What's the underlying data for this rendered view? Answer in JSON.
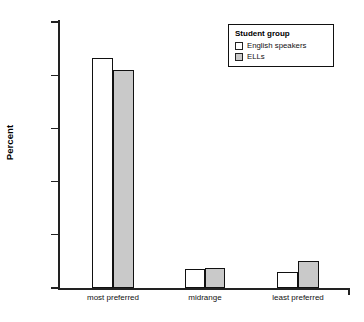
{
  "chart_data": {
    "type": "bar",
    "title": "",
    "xlabel": "",
    "ylabel": "Percent",
    "categories": [
      "most preferred",
      "midrange",
      "least preferred"
    ],
    "series": [
      {
        "name": "English speakers",
        "color": "#ffffff",
        "values": [
          86.5,
          7.0,
          6.0
        ]
      },
      {
        "name": "ELLs",
        "color": "#c9c9c9",
        "values": [
          82.0,
          7.5,
          10.0
        ]
      }
    ],
    "ylim": [
      0,
      100
    ],
    "ytick_labels": [
      "0.0%",
      "20.0%",
      "40.0%",
      "60.0%",
      "80.0%",
      "100.0%"
    ],
    "ytick_values": [
      0,
      20,
      40,
      60,
      80,
      100
    ],
    "grid": false,
    "legend_position": "top-right"
  },
  "legend": {
    "title": "Student group",
    "entries": [
      {
        "label": "English speakers",
        "swatch": "white"
      },
      {
        "label": "ELLs",
        "swatch": "gray"
      }
    ]
  },
  "axis": {
    "y_title": "Percent"
  },
  "colors": {
    "english_speakers": "#ffffff",
    "ells": "#c9c9c9",
    "outline": "#111111",
    "axis": "#222222",
    "background": "#ffffff"
  }
}
